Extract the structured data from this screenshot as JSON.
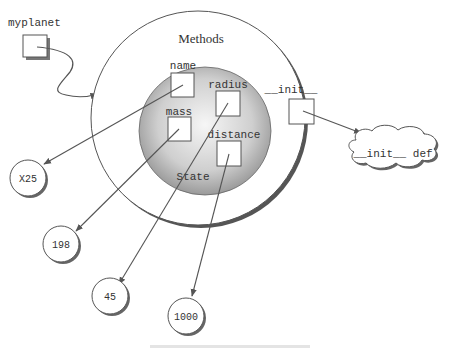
{
  "diagram": {
    "variable": {
      "label": "myplanet"
    },
    "object": {
      "methods_label": "Methods",
      "state_label": "State",
      "attributes": [
        {
          "name": "name",
          "value": "X25"
        },
        {
          "name": "mass",
          "value": "198"
        },
        {
          "name": "radius",
          "value": "45"
        },
        {
          "name": "distance",
          "value": "1000"
        }
      ],
      "method": {
        "name": "__init__",
        "definition": "__init__ def"
      }
    },
    "caption": ""
  },
  "colors": {
    "line": "#555555",
    "state_fill_center": "#f4f4f4",
    "state_fill_edge": "#9a9a9a",
    "shadow": "#777777"
  }
}
